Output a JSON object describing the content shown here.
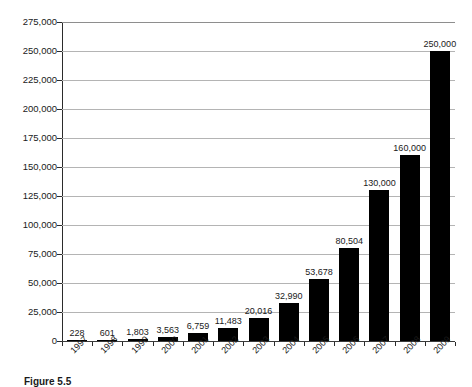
{
  "caption": "Figure 5.5",
  "colors": {
    "bar": "#000000",
    "gridline": "#b4b4b4",
    "axis": "#2b2b2b",
    "background": "#ffffff",
    "text": "#1a1a1a"
  },
  "chart_data": {
    "type": "bar",
    "title": "",
    "xlabel": "",
    "ylabel": "",
    "categories": [
      "1997",
      "1998",
      "1999",
      "2000",
      "2001",
      "2002",
      "2003",
      "2004",
      "2005",
      "2006",
      "2007",
      "2008",
      "2009"
    ],
    "values": [
      228,
      601,
      1803,
      3563,
      6759,
      11483,
      20016,
      32990,
      53678,
      80504,
      130000,
      160000,
      250000
    ],
    "value_labels": [
      "228",
      "601",
      "1,803",
      "3,563",
      "6,759",
      "11,483",
      "20,016",
      "32,990",
      "53,678",
      "80,504",
      "130,000",
      "160,000",
      "250,000"
    ],
    "ylim": [
      0,
      275000
    ],
    "ytick_values": [
      0,
      25000,
      50000,
      75000,
      100000,
      125000,
      150000,
      175000,
      200000,
      225000,
      250000,
      275000
    ],
    "ytick_labels": [
      "0",
      "25,000",
      "50,000",
      "75,000",
      "100,000",
      "125,000",
      "150,000",
      "175,000",
      "200,000",
      "225,000",
      "250,000",
      "275,000"
    ],
    "grid": true,
    "legend": false,
    "legend_position": "none",
    "data_labels": true,
    "xlabel_rotation": -45
  }
}
